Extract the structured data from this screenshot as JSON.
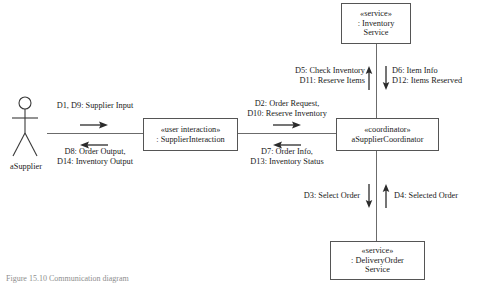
{
  "diagram": {
    "type": "uml-communication-diagram",
    "caption": "Figure 15.10  Communication diagram",
    "line_color": "#6b6b6b",
    "border_color": "#555555",
    "text_color": "#1a1a1a"
  },
  "actor": {
    "name": "aSupplier",
    "icon": "stick-figure-actor"
  },
  "nodes": [
    {
      "id": "supplier-interaction",
      "stereotype": "«user interaction»",
      "instance": ": SupplierInteraction"
    },
    {
      "id": "coordinator",
      "stereotype": "«coordinator»",
      "instance": "aSupplierCoordinator"
    },
    {
      "id": "inventory-service",
      "stereotype": "«service»",
      "instance_line1": ": Inventory",
      "instance_line2": "Service"
    },
    {
      "id": "delivery-order-service",
      "stereotype": "«service»",
      "instance_line1": ": DeliveryOrder",
      "instance_line2": "Service"
    }
  ],
  "messages": {
    "actor_to_interaction": {
      "line1": "D1, D9: Supplier Input",
      "direction": "right"
    },
    "interaction_to_actor": {
      "line1": "D8: Order Output,",
      "line2": "D14: Inventory Output",
      "direction": "left"
    },
    "interaction_to_coordinator": {
      "line1": "D2: Order Request,",
      "line2": "D10: Reserve Inventory",
      "direction": "right"
    },
    "coordinator_to_interaction": {
      "line1": "D7: Order Info,",
      "line2": "D13: Inventory Status",
      "direction": "left"
    },
    "coordinator_to_inventory": {
      "line1": "D5: Check Inventory",
      "line2": "D11: Reserve Items",
      "direction": "up"
    },
    "inventory_to_coordinator": {
      "line1": "D6: Item Info",
      "line2": "D12: Items Reserved",
      "direction": "down"
    },
    "coordinator_to_delivery": {
      "line1": "D3: Select Order",
      "direction": "down"
    },
    "delivery_to_coordinator": {
      "line1": "D4: Selected Order",
      "direction": "up"
    }
  }
}
